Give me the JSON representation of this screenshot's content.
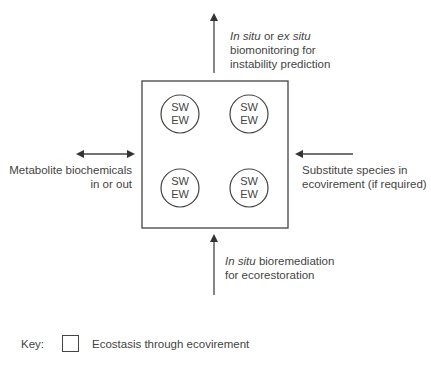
{
  "diagram": {
    "central_box": {
      "circles": [
        {
          "line1": "SW",
          "line2": "EW"
        },
        {
          "line1": "SW",
          "line2": "EW"
        },
        {
          "line1": "SW",
          "line2": "EW"
        },
        {
          "line1": "SW",
          "line2": "EW"
        }
      ]
    },
    "top_label": {
      "italic1": "In situ",
      "mid": " or ",
      "italic2": "ex situ",
      "line2": "biomonitoring for",
      "line3": "instability prediction"
    },
    "left_label": {
      "line1": "Metabolite biochemicals",
      "line2": "in or out"
    },
    "right_label": {
      "line1": "Substitute species in",
      "line2": "ecovirement (if required)"
    },
    "bottom_label": {
      "italic": "In situ",
      "rest": " bioremediation",
      "line2": "for ecorestoration"
    },
    "key": {
      "label": "Key:",
      "description": "Ecostasis through ecovirement"
    },
    "colors": {
      "stroke": "#444444",
      "text": "#444444",
      "background": "#ffffff"
    }
  }
}
